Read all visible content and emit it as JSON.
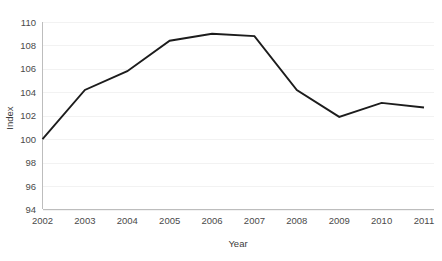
{
  "chart_data": {
    "type": "line",
    "title": "",
    "xlabel": "Year",
    "ylabel": "Index",
    "x": [
      2002,
      2003,
      2004,
      2005,
      2006,
      2007,
      2008,
      2009,
      2010,
      2011
    ],
    "categories": [
      "2002",
      "2003",
      "2004",
      "2005",
      "2006",
      "2007",
      "2008",
      "2009",
      "2010",
      "2011"
    ],
    "values": [
      100.0,
      104.2,
      105.8,
      108.4,
      109.0,
      108.8,
      104.2,
      101.9,
      103.1,
      102.7
    ],
    "series": [
      {
        "name": "Index",
        "values": [
          100.0,
          104.2,
          105.8,
          108.4,
          109.0,
          108.8,
          104.2,
          101.9,
          103.1,
          102.7
        ]
      }
    ],
    "ylim": [
      94,
      110
    ],
    "yticks": [
      94,
      96,
      98,
      100,
      102,
      104,
      106,
      108,
      110
    ],
    "ytick_labels": [
      "94",
      "96",
      "98",
      "100",
      "102",
      "104",
      "106",
      "108",
      "110"
    ],
    "xticks": [
      2002,
      2003,
      2004,
      2005,
      2006,
      2007,
      2008,
      2009,
      2010,
      2011
    ],
    "xtick_labels": [
      "2002",
      "2003",
      "2004",
      "2005",
      "2006",
      "2007",
      "2008",
      "2009",
      "2010",
      "2011"
    ],
    "grid": true,
    "grid_axis": "y",
    "legend": false,
    "legend_position": "none",
    "markers": false,
    "line_color": "#1c1c1c",
    "grid_color": "#f2f2f2",
    "axis_color": "#bdbdbd",
    "background_color": "#ffffff",
    "text_color": "#4a4a4a"
  }
}
